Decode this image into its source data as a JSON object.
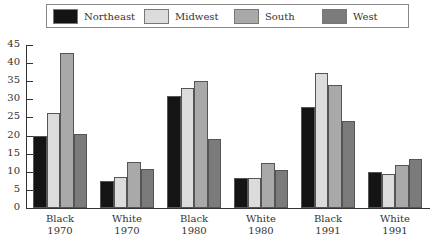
{
  "chart_data": {
    "type": "bar",
    "title": "",
    "xlabel": "",
    "ylabel": "",
    "ylim": [
      0,
      45
    ],
    "yticks": [
      0,
      5,
      10,
      15,
      20,
      25,
      30,
      35,
      40,
      45
    ],
    "grid": false,
    "legend_position": "top",
    "categories": [
      "Black 1970",
      "White 1970",
      "Black 1980",
      "White 1980",
      "Black 1991",
      "White 1991"
    ],
    "category_lines": [
      [
        "Black",
        "1970"
      ],
      [
        "White",
        "1970"
      ],
      [
        "Black",
        "1980"
      ],
      [
        "White",
        "1980"
      ],
      [
        "Black",
        "1991"
      ],
      [
        "White",
        "1991"
      ]
    ],
    "series": [
      {
        "name": "Northeast",
        "color": "#141414",
        "values": [
          20,
          7.5,
          31,
          8.4,
          27.9,
          9.9
        ]
      },
      {
        "name": "Midwest",
        "color": "#dcdcdc",
        "values": [
          26.2,
          8.6,
          33,
          8.4,
          37.3,
          9.4
        ]
      },
      {
        "name": "South",
        "color": "#a9a9a9",
        "values": [
          42.7,
          12.7,
          35,
          12.3,
          34,
          11.9
        ]
      },
      {
        "name": "West",
        "color": "#7b7b7b",
        "values": [
          20.5,
          10.8,
          19,
          10.5,
          24,
          13.5
        ]
      }
    ]
  }
}
